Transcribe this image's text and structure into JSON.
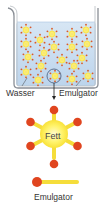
{
  "labels": {
    "water": "Wasser",
    "emulsifier_top": "Emulgator",
    "fat": "Fett",
    "emulsifier_bottom": "Emulgator"
  },
  "colors": {
    "water": "#c9ddf0",
    "beaker_outline": "#8a8f96",
    "fat_core": "#fff36a",
    "emulsifier_tail": "#f5dd3a",
    "emulsifier_head": "#e0451f",
    "text": "#333333"
  },
  "micelles": [
    {
      "x": 26,
      "y": 30
    },
    {
      "x": 52,
      "y": 34
    },
    {
      "x": 72,
      "y": 34
    },
    {
      "x": 86,
      "y": 30
    },
    {
      "x": 26,
      "y": 44
    },
    {
      "x": 40,
      "y": 40
    },
    {
      "x": 54,
      "y": 47
    },
    {
      "x": 72,
      "y": 47
    },
    {
      "x": 87,
      "y": 44
    },
    {
      "x": 28,
      "y": 57
    },
    {
      "x": 44,
      "y": 53
    },
    {
      "x": 62,
      "y": 60
    },
    {
      "x": 82,
      "y": 58
    },
    {
      "x": 26,
      "y": 72
    },
    {
      "x": 41,
      "y": 66
    },
    {
      "x": 74,
      "y": 66
    },
    {
      "x": 38,
      "y": 80
    },
    {
      "x": 55,
      "y": 76
    },
    {
      "x": 72,
      "y": 79
    },
    {
      "x": 88,
      "y": 76
    }
  ],
  "highlighted_micelle": {
    "x": 54,
    "y": 76
  }
}
